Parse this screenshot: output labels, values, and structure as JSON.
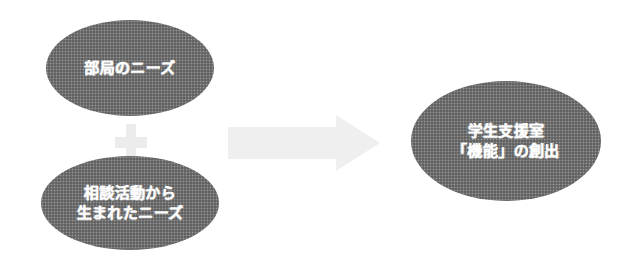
{
  "figure": {
    "type": "concept-flow-diagram",
    "background_color": "#ffffff",
    "shape_fill_color": "#6b6b6b",
    "shape_text_color": "#ffffff",
    "connector_color": "#ececec"
  },
  "nodes": {
    "dept_needs": {
      "label": "部局のニーズ",
      "shape": "ellipse"
    },
    "consultation_needs": {
      "label": "相談活動から\n生まれたニーズ",
      "shape": "ellipse"
    },
    "outcome": {
      "label": "学生支援室\n「機能」の創出",
      "shape": "ellipse"
    }
  },
  "connectors": {
    "plus": {
      "icon": "plus-icon",
      "symbol": "+"
    },
    "arrow": {
      "icon": "right-block-arrow-icon",
      "direction": "right"
    }
  }
}
